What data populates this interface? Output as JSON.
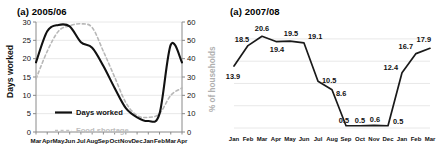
{
  "figure": {
    "left_panel_title": "(a) 2005/06",
    "right_panel_title": "(a) 2007/08"
  },
  "chart_data": [
    {
      "type": "line",
      "title": "(a) 2005/06",
      "xlabel": "",
      "ylabel": "Days worked",
      "y2label": "% of households",
      "ylim": [
        0,
        30
      ],
      "y2lim": [
        0,
        60
      ],
      "yticks": [
        0,
        5,
        10,
        15,
        20,
        25,
        30
      ],
      "y2ticks": [
        0,
        10,
        20,
        30,
        40,
        50,
        60
      ],
      "grid": true,
      "legend_position": "center-left",
      "categories": [
        "Mar",
        "Apr",
        "May",
        "Jun",
        "Jul",
        "Aug",
        "Sep",
        "Oct",
        "Nov",
        "Dec",
        "Jan",
        "Feb",
        "Mar",
        "Apr"
      ],
      "series": [
        {
          "name": "Days worked",
          "axis": "left",
          "style": "solid",
          "color": "#111111",
          "values": [
            19.0,
            27.5,
            29.2,
            28.8,
            24.5,
            23.0,
            18.0,
            12.0,
            6.5,
            4.0,
            3.0,
            5.0,
            23.8,
            19.0
          ]
        },
        {
          "name": "Food shortage",
          "axis": "right",
          "style": "dashed",
          "color": "#b8b8b8",
          "values": [
            29.0,
            44.0,
            55.0,
            58.0,
            59.0,
            57.0,
            44.0,
            30.0,
            16.0,
            9.0,
            8.0,
            10.0,
            20.0,
            24.0
          ]
        }
      ],
      "legend": [
        {
          "label": "Days worked",
          "style": "solid",
          "color": "#111111"
        },
        {
          "label": "Food shortage",
          "style": "dashed",
          "color": "#c2c2c2"
        }
      ]
    },
    {
      "type": "line",
      "title": "(a) 2007/08",
      "xlabel": "",
      "ylabel": "",
      "ylim": [
        0,
        22
      ],
      "grid": true,
      "show_data_labels": true,
      "categories": [
        "Jan",
        "Feb",
        "Mar",
        "Apr",
        "May",
        "Jun",
        "Jul",
        "Aug",
        "Sep",
        "Oct",
        "Nov",
        "Dec",
        "Jan",
        "Feb",
        "Mar"
      ],
      "series": [
        {
          "name": "2007/08",
          "style": "solid",
          "color": "#1a1a1a",
          "values": [
            13.9,
            18.5,
            20.6,
            19.4,
            19.5,
            19.1,
            10.5,
            8.6,
            0.5,
            0.5,
            0.6,
            0.5,
            12.4,
            16.7,
            17.9
          ]
        }
      ],
      "data_labels": [
        "13.9",
        "18.5",
        "20.6",
        "19.4",
        "19.5",
        "19.1",
        "10.5",
        "8.6",
        "0.5",
        "0.5",
        "0.6",
        "0.5",
        "12.4",
        "16.7",
        "17.9"
      ]
    }
  ]
}
